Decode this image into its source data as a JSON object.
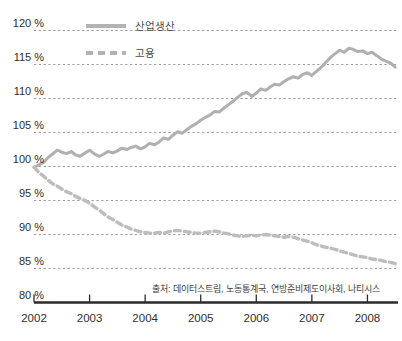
{
  "chart_data": {
    "type": "line",
    "title": "",
    "subtitle": "",
    "xlabel": "",
    "ylabel": "",
    "ylim": [
      80,
      120
    ],
    "xlim": [
      2002.0,
      2008.55
    ],
    "grid": true,
    "y_ticks": [
      80,
      85,
      90,
      95,
      100,
      105,
      110,
      115,
      120
    ],
    "y_tick_labels": [
      "80 %",
      "85 %",
      "90 %",
      "95 %",
      "100 %",
      "105 %",
      "110 %",
      "115 %",
      "120 %"
    ],
    "x_ticks": [
      2002,
      2003,
      2004,
      2005,
      2006,
      2007,
      2008
    ],
    "x_tick_labels": [
      "2002",
      "2003",
      "2004",
      "2005",
      "2006",
      "2007",
      "2008"
    ],
    "legend_position": "top-left",
    "index_base": 100,
    "units": "percent",
    "series": [
      {
        "name": "산업생산",
        "style": "solid",
        "color": "#b0b0b0",
        "x": [
          2002.0,
          2002.08,
          2002.17,
          2002.25,
          2002.33,
          2002.42,
          2002.5,
          2002.58,
          2002.67,
          2002.75,
          2002.83,
          2002.92,
          2003.0,
          2003.08,
          2003.17,
          2003.25,
          2003.33,
          2003.42,
          2003.5,
          2003.58,
          2003.67,
          2003.75,
          2003.83,
          2003.92,
          2004.0,
          2004.08,
          2004.17,
          2004.25,
          2004.33,
          2004.42,
          2004.5,
          2004.58,
          2004.67,
          2004.75,
          2004.83,
          2004.92,
          2005.0,
          2005.08,
          2005.17,
          2005.25,
          2005.33,
          2005.42,
          2005.5,
          2005.58,
          2005.67,
          2005.75,
          2005.83,
          2005.92,
          2006.0,
          2006.08,
          2006.17,
          2006.25,
          2006.33,
          2006.42,
          2006.5,
          2006.58,
          2006.67,
          2006.75,
          2006.83,
          2006.92,
          2007.0,
          2007.08,
          2007.17,
          2007.25,
          2007.33,
          2007.42,
          2007.5,
          2007.58,
          2007.67,
          2007.75,
          2007.83,
          2007.92,
          2008.0,
          2008.08,
          2008.17,
          2008.25,
          2008.33,
          2008.42,
          2008.5
        ],
        "values": [
          99.9,
          100.2,
          100.6,
          101.3,
          101.8,
          102.4,
          102.1,
          101.9,
          102.2,
          101.7,
          101.5,
          102.0,
          102.4,
          101.9,
          101.5,
          101.8,
          102.2,
          102.0,
          102.3,
          102.7,
          102.5,
          102.8,
          103.0,
          102.6,
          102.9,
          103.4,
          103.2,
          103.6,
          104.2,
          104.0,
          104.6,
          105.1,
          104.9,
          105.4,
          105.9,
          106.3,
          106.8,
          107.2,
          107.6,
          108.1,
          108.0,
          108.6,
          109.1,
          109.6,
          110.2,
          110.7,
          110.9,
          110.3,
          110.8,
          111.4,
          111.2,
          111.7,
          112.1,
          112.0,
          112.5,
          112.9,
          113.2,
          113.0,
          113.5,
          113.8,
          113.4,
          114.0,
          114.6,
          115.3,
          116.0,
          116.6,
          117.1,
          116.8,
          117.4,
          117.2,
          116.9,
          117.0,
          116.6,
          116.8,
          116.3,
          115.8,
          115.5,
          115.2,
          114.6
        ]
      },
      {
        "name": "고용",
        "style": "dashed",
        "color": "#bdbdbd",
        "x": [
          2002.0,
          2002.08,
          2002.17,
          2002.25,
          2002.33,
          2002.42,
          2002.5,
          2002.58,
          2002.67,
          2002.75,
          2002.83,
          2002.92,
          2003.0,
          2003.08,
          2003.17,
          2003.25,
          2003.33,
          2003.42,
          2003.5,
          2003.58,
          2003.67,
          2003.75,
          2003.83,
          2003.92,
          2004.0,
          2004.08,
          2004.17,
          2004.25,
          2004.33,
          2004.42,
          2004.5,
          2004.58,
          2004.67,
          2004.75,
          2004.83,
          2004.92,
          2005.0,
          2005.08,
          2005.17,
          2005.25,
          2005.33,
          2005.42,
          2005.5,
          2005.58,
          2005.67,
          2005.75,
          2005.83,
          2005.92,
          2006.0,
          2006.08,
          2006.17,
          2006.25,
          2006.33,
          2006.42,
          2006.5,
          2006.58,
          2006.67,
          2006.75,
          2006.83,
          2006.92,
          2007.0,
          2007.08,
          2007.17,
          2007.25,
          2007.33,
          2007.42,
          2007.5,
          2007.58,
          2007.67,
          2007.75,
          2007.83,
          2007.92,
          2008.0,
          2008.08,
          2008.17,
          2008.25,
          2008.33,
          2008.42,
          2008.5
        ],
        "values": [
          99.9,
          99.2,
          98.6,
          98.0,
          97.5,
          97.1,
          96.7,
          96.3,
          96.0,
          95.6,
          95.3,
          95.0,
          94.6,
          94.1,
          93.6,
          93.1,
          92.6,
          92.2,
          91.8,
          91.4,
          91.1,
          90.8,
          90.6,
          90.4,
          90.3,
          90.2,
          90.2,
          90.3,
          90.2,
          90.4,
          90.5,
          90.6,
          90.5,
          90.4,
          90.3,
          90.2,
          90.2,
          90.3,
          90.4,
          90.5,
          90.4,
          90.2,
          90.1,
          89.9,
          89.8,
          89.7,
          89.8,
          89.9,
          89.8,
          89.9,
          90.0,
          89.9,
          89.8,
          89.7,
          89.6,
          89.7,
          89.6,
          89.4,
          89.2,
          89.0,
          88.8,
          88.5,
          88.3,
          88.1,
          88.0,
          87.8,
          87.6,
          87.4,
          87.2,
          87.0,
          86.8,
          86.7,
          86.6,
          86.4,
          86.3,
          86.2,
          86.0,
          85.9,
          85.7
        ]
      }
    ],
    "source_note": "출처: 데이터스트림, 노동통계국, 연방준비제도이사회, 나티시스"
  },
  "legend": {
    "items": [
      {
        "label": "산업생산"
      },
      {
        "label": "고용"
      }
    ]
  },
  "colors": {
    "series_solid": "#b0b0b0",
    "series_dashed": "#bdbdbd",
    "gridline": "#9a9a9a",
    "axis": "#2b2b2b",
    "text": "#2e2e2e"
  }
}
